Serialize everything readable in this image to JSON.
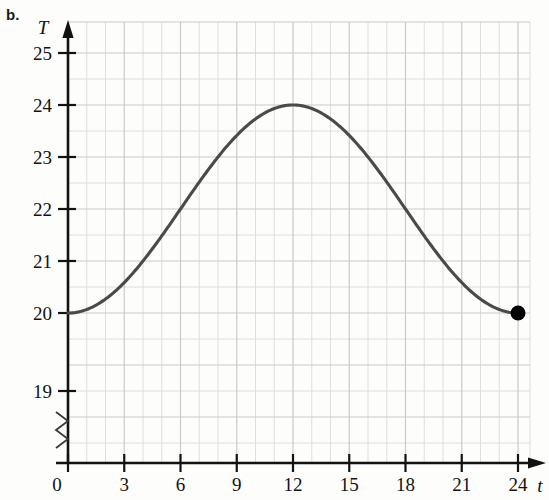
{
  "figure": {
    "part_label": "b.",
    "background_color": "#fdfdfc",
    "curve_color": "#4a4a4a",
    "grid_color": "#c9c9c9",
    "grid_minor_color": "#dedede",
    "axis_color": "#121212",
    "point_color": "#000000"
  },
  "chart_data": {
    "type": "line",
    "title": "",
    "subtitle": "",
    "xlabel": "t",
    "ylabel": "T",
    "xlim": [
      0,
      24.8
    ],
    "ylim": [
      18.55,
      25.35
    ],
    "axis_break": true,
    "axis_break_note": "y-axis broken between 0 and 19",
    "grid": true,
    "grid_major_x_step": 3,
    "grid_minor_x_step": 1,
    "grid_major_y_step": 1,
    "grid_minor_y_step": 0.5,
    "legend": "none",
    "xticks": [
      0,
      3,
      6,
      9,
      12,
      15,
      18,
      21,
      24
    ],
    "xtick_labels": [
      "0",
      "3",
      "6",
      "9",
      "12",
      "15",
      "18",
      "21",
      "24"
    ],
    "yticks": [
      19,
      20,
      21,
      22,
      23,
      24,
      25
    ],
    "ytick_labels": [
      "19",
      "20",
      "21",
      "22",
      "23",
      "24",
      "25"
    ],
    "series": [
      {
        "name": "Temperature",
        "equation": "T = 22 - 2*cos(pi*t/12)",
        "x": [
          0,
          1,
          2,
          3,
          4,
          5,
          6,
          7,
          8,
          9,
          10,
          11,
          12,
          13,
          14,
          15,
          16,
          17,
          18,
          19,
          20,
          21,
          22,
          23,
          24
        ],
        "values": [
          20.0,
          20.07,
          20.27,
          20.59,
          21.0,
          21.48,
          22.0,
          22.52,
          23.0,
          23.41,
          23.73,
          23.93,
          24.0,
          23.93,
          23.73,
          23.41,
          23.0,
          22.52,
          22.0,
          21.48,
          21.0,
          20.59,
          20.27,
          20.07,
          20.0
        ]
      }
    ],
    "annotations": [
      {
        "type": "point",
        "name": "endpoint-dot",
        "x": 24,
        "y": 20,
        "filled": true,
        "label": ""
      }
    ],
    "key_values": {
      "minimum": 20,
      "maximum": 24,
      "maximum_at_t": 12,
      "period": 24,
      "amplitude": 2,
      "midline": 22
    }
  }
}
